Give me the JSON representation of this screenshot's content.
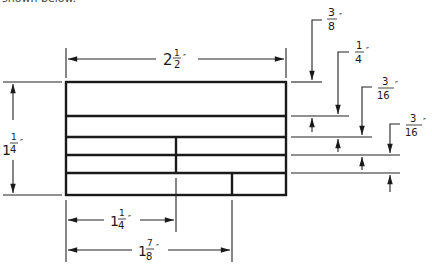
{
  "header_fragment": "shown below.",
  "dimensions": {
    "overall_width": {
      "whole": "2",
      "num": "1",
      "den": "2",
      "mark": "″"
    },
    "overall_height": {
      "whole": "1",
      "num": "1",
      "den": "4",
      "mark": "″"
    },
    "divider_offset": {
      "whole": "1",
      "num": "1",
      "den": "4",
      "mark": "″"
    },
    "second_divider_offset": {
      "whole": "1",
      "num": "7",
      "den": "8",
      "mark": "″"
    },
    "row1": {
      "whole": "",
      "num": "3",
      "den": "8",
      "mark": "″"
    },
    "row2": {
      "whole": "",
      "num": "1",
      "den": "4",
      "mark": "″"
    },
    "row3": {
      "whole": "",
      "num": "3",
      "den": "16",
      "mark": "″"
    },
    "row4": {
      "whole": "",
      "num": "3",
      "den": "16",
      "mark": "″"
    }
  },
  "colors": {
    "line": "#1a1a1a",
    "background": "#ffffff"
  }
}
